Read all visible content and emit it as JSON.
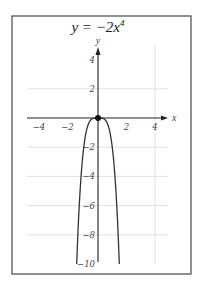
{
  "chart_data": {
    "type": "line",
    "title_parts": {
      "prefix": "y = −2",
      "var": "x",
      "exp": "4"
    },
    "xlabel": "x",
    "ylabel": "y",
    "xlim": [
      -5,
      5
    ],
    "ylim": [
      -10,
      5
    ],
    "x_ticks": [
      -4,
      -2,
      2,
      4
    ],
    "x_tick_labels": [
      "−4",
      "−2",
      "2",
      "4"
    ],
    "y_ticks": [
      4,
      2,
      -2,
      -4,
      -6,
      -8,
      -10
    ],
    "y_tick_labels": [
      "4",
      "2",
      "−2",
      "−4",
      "−6",
      "−8",
      "−10"
    ],
    "grid": true,
    "vertical_gridlines": [
      4
    ],
    "horizontal_gridlines": [
      2,
      -2,
      -4,
      -6,
      -8
    ],
    "series": [
      {
        "name": "y = -2x^4",
        "function": "-2*x^4",
        "x": [
          -1.495,
          -1.4,
          -1.3,
          -1.2,
          -1.1,
          -1.0,
          -0.9,
          -0.8,
          -0.7,
          -0.6,
          -0.5,
          -0.4,
          -0.3,
          -0.2,
          -0.1,
          0,
          0.1,
          0.2,
          0.3,
          0.4,
          0.5,
          0.6,
          0.7,
          0.8,
          0.9,
          1.0,
          1.1,
          1.2,
          1.3,
          1.4,
          1.495
        ],
        "y": [
          -10.0,
          -7.68,
          -5.71,
          -4.15,
          -2.93,
          -2.0,
          -1.31,
          -0.82,
          -0.48,
          -0.26,
          -0.125,
          -0.05,
          -0.016,
          -0.003,
          0,
          0,
          0,
          -0.003,
          -0.016,
          -0.05,
          -0.125,
          -0.26,
          -0.48,
          -0.82,
          -1.31,
          -2.0,
          -2.93,
          -4.15,
          -5.71,
          -7.68,
          -10.0
        ]
      }
    ],
    "points": [
      {
        "label": "vertex",
        "x": 0,
        "y": 0
      }
    ],
    "legend": null
  }
}
